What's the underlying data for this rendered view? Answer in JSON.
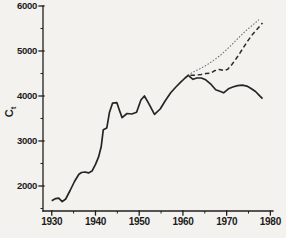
{
  "figure": {
    "ylabel_main": "C",
    "ylabel_sub": "t"
  },
  "chart_data": {
    "type": "line",
    "title": "",
    "xlabel": "",
    "ylabel": "Ct",
    "legend": "none",
    "grid": false,
    "xlim": [
      1928,
      1980.6
    ],
    "ylim": [
      1444,
      6000
    ],
    "xticks": [
      1930,
      1940,
      1950,
      1960,
      1970,
      1980
    ],
    "xticks_minor": [
      1935,
      1945,
      1955,
      1965,
      1975
    ],
    "yticks": [
      2000,
      3000,
      4000,
      5000,
      6000
    ],
    "yticks_minor": [
      1500,
      2500,
      3500,
      4500,
      5500
    ],
    "series": [
      {
        "name": "actual",
        "style": "solid",
        "points": [
          [
            1930.0,
            1670
          ],
          [
            1930.9,
            1720
          ],
          [
            1931.6,
            1730
          ],
          [
            1932.4,
            1650
          ],
          [
            1933.2,
            1710
          ],
          [
            1934.2,
            1900
          ],
          [
            1935.2,
            2100
          ],
          [
            1936.2,
            2260
          ],
          [
            1936.8,
            2300
          ],
          [
            1937.6,
            2310
          ],
          [
            1938.4,
            2290
          ],
          [
            1939.2,
            2330
          ],
          [
            1940.0,
            2480
          ],
          [
            1940.7,
            2640
          ],
          [
            1941.3,
            2870
          ],
          [
            1941.8,
            3250
          ],
          [
            1942.6,
            3290
          ],
          [
            1943.2,
            3640
          ],
          [
            1943.9,
            3840
          ],
          [
            1944.9,
            3850
          ],
          [
            1945.5,
            3680
          ],
          [
            1946.1,
            3520
          ],
          [
            1947.2,
            3610
          ],
          [
            1948.3,
            3600
          ],
          [
            1949.4,
            3640
          ],
          [
            1950.4,
            3910
          ],
          [
            1951.2,
            4000
          ],
          [
            1952.2,
            3830
          ],
          [
            1953.5,
            3590
          ],
          [
            1954.8,
            3710
          ],
          [
            1956.0,
            3900
          ],
          [
            1957.2,
            4070
          ],
          [
            1958.4,
            4200
          ],
          [
            1959.6,
            4320
          ],
          [
            1960.5,
            4400
          ],
          [
            1961.2,
            4460
          ],
          [
            1962.3,
            4370
          ],
          [
            1963.2,
            4400
          ],
          [
            1964.2,
            4400
          ],
          [
            1965.2,
            4360
          ],
          [
            1966.3,
            4270
          ],
          [
            1967.5,
            4140
          ],
          [
            1968.6,
            4100
          ],
          [
            1969.3,
            4070
          ],
          [
            1970.4,
            4160
          ],
          [
            1971.4,
            4200
          ],
          [
            1972.5,
            4230
          ],
          [
            1973.6,
            4240
          ],
          [
            1974.6,
            4220
          ],
          [
            1975.5,
            4170
          ],
          [
            1976.6,
            4100
          ],
          [
            1977.4,
            4020
          ],
          [
            1978.2,
            3940
          ]
        ]
      },
      {
        "name": "projection-dotted",
        "style": "dotted",
        "points": [
          [
            1961.2,
            4470
          ],
          [
            1962.5,
            4540
          ],
          [
            1964.0,
            4610
          ],
          [
            1965.5,
            4690
          ],
          [
            1967.0,
            4790
          ],
          [
            1968.5,
            4900
          ],
          [
            1970.0,
            5030
          ],
          [
            1971.5,
            5170
          ],
          [
            1973.0,
            5320
          ],
          [
            1974.5,
            5460
          ],
          [
            1976.0,
            5580
          ],
          [
            1977.3,
            5690
          ]
        ]
      },
      {
        "name": "projection-dashed",
        "style": "dashed",
        "points": [
          [
            1961.7,
            4460
          ],
          [
            1963.0,
            4465
          ],
          [
            1964.2,
            4480
          ],
          [
            1965.3,
            4500
          ],
          [
            1966.4,
            4510
          ],
          [
            1967.2,
            4560
          ],
          [
            1968.3,
            4590
          ],
          [
            1969.4,
            4565
          ],
          [
            1970.2,
            4590
          ],
          [
            1971.2,
            4700
          ],
          [
            1972.4,
            4860
          ],
          [
            1973.6,
            5040
          ],
          [
            1974.8,
            5220
          ],
          [
            1976.0,
            5380
          ],
          [
            1977.0,
            5490
          ],
          [
            1978.2,
            5620
          ]
        ]
      }
    ]
  }
}
